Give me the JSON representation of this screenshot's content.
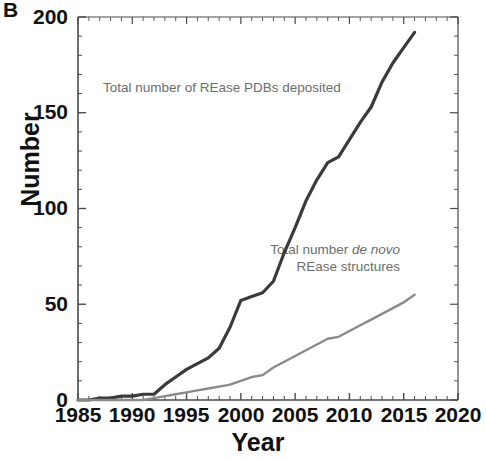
{
  "panel": {
    "label": "B"
  },
  "axes": {
    "xlabel": "Year",
    "ylabel": "Number",
    "x_ticks": [
      "1985",
      "1990",
      "1995",
      "2000",
      "2005",
      "2010",
      "2015",
      "2020"
    ],
    "y_ticks": [
      "0",
      "50",
      "100",
      "150",
      "200"
    ],
    "x_min": 1985,
    "x_max": 2020,
    "y_min": 0,
    "y_max": 200
  },
  "annotations": {
    "series1_pre": "Total number of REase PDBs deposited",
    "series2_line1_pre": "Total number ",
    "series2_line1_it": "de novo",
    "series2_line2": "REase structures"
  },
  "colors": {
    "series1": "#3a3a3a",
    "series2": "#8a8a8a",
    "axis": "#4a4a4a",
    "text": "#111111",
    "annotation": "#6d6d6d"
  },
  "chart_data": {
    "type": "line",
    "title": "",
    "xlabel": "Year",
    "ylabel": "Number",
    "xlim": [
      1985,
      2020
    ],
    "ylim": [
      0,
      200
    ],
    "x_major_ticks": [
      1985,
      1990,
      1995,
      2000,
      2005,
      2010,
      2015,
      2020
    ],
    "y_major_ticks": [
      0,
      50,
      100,
      150,
      200
    ],
    "x_minor_tick_step": 1,
    "y_minor_tick_step": 10,
    "grid": false,
    "legend": "annotations on plot",
    "x": [
      1985,
      1986,
      1987,
      1988,
      1989,
      1990,
      1991,
      1992,
      1993,
      1994,
      1995,
      1996,
      1997,
      1998,
      1999,
      2000,
      2001,
      2002,
      2003,
      2004,
      2005,
      2006,
      2007,
      2008,
      2009,
      2010,
      2011,
      2012,
      2013,
      2014,
      2015,
      2016
    ],
    "series": [
      {
        "name": "Total number of REase PDBs deposited",
        "color": "#3a3a3a",
        "values": [
          0,
          0,
          1,
          1,
          2,
          2,
          3,
          3,
          8,
          12,
          16,
          19,
          22,
          27,
          38,
          52,
          54,
          56,
          62,
          77,
          90,
          104,
          115,
          124,
          127,
          136,
          145,
          153,
          166,
          176,
          184,
          192
        ]
      },
      {
        "name": "Total number de novo REase structures",
        "color": "#8a8a8a",
        "values": [
          0,
          0,
          0,
          0,
          0,
          0,
          0,
          1,
          2,
          3,
          4,
          5,
          6,
          7,
          8,
          10,
          12,
          13,
          17,
          20,
          23,
          26,
          29,
          32,
          33,
          36,
          39,
          42,
          45,
          48,
          51,
          55
        ]
      }
    ]
  }
}
